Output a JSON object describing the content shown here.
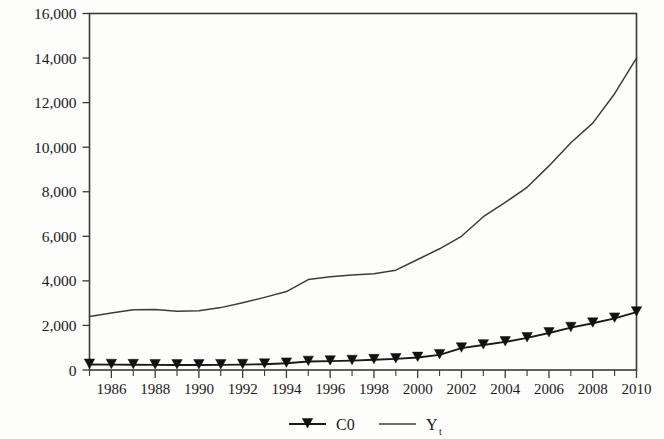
{
  "chart_data": {
    "type": "line",
    "title": "",
    "subtitle": "",
    "xlabel": "",
    "ylabel": "",
    "xlim": [
      1985,
      2010
    ],
    "ylim": [
      0,
      16000
    ],
    "grid": false,
    "legend_position": "bottom-center",
    "x": [
      1985,
      1986,
      1987,
      1988,
      1989,
      1990,
      1991,
      1992,
      1993,
      1994,
      1995,
      1996,
      1997,
      1998,
      1999,
      2000,
      2001,
      2002,
      2003,
      2004,
      2005,
      2006,
      2007,
      2008,
      2009,
      2010
    ],
    "y_tick_values": [
      0,
      2000,
      4000,
      6000,
      8000,
      10000,
      12000,
      14000,
      16000
    ],
    "y_tick_labels": [
      "0",
      "2,000",
      "4,000",
      "6,000",
      "8,000",
      "10,000",
      "12,000",
      "14,000",
      "16,000"
    ],
    "x_tick_values": [
      1986,
      1988,
      1990,
      1992,
      1994,
      1996,
      1998,
      2000,
      2002,
      2004,
      2006,
      2008,
      2010
    ],
    "x_tick_labels": [
      "1986",
      "1988",
      "1990",
      "1992",
      "1994",
      "1996",
      "1998",
      "2000",
      "2002",
      "2004",
      "2006",
      "2008",
      "2010"
    ],
    "x_minor_ticks_every": 1,
    "series": [
      {
        "name": "C0",
        "legend_label": "C0",
        "marker": "triangle-down",
        "color": "#1a1a1a",
        "values": [
          250,
          240,
          235,
          230,
          225,
          225,
          230,
          240,
          260,
          300,
          380,
          400,
          420,
          460,
          500,
          560,
          680,
          980,
          1120,
          1260,
          1440,
          1660,
          1900,
          2100,
          2320,
          2600
        ]
      },
      {
        "name": "Y",
        "legend_label": "Y",
        "legend_label_subscript": "t",
        "marker": "none",
        "color": "#3c3c3c",
        "values": [
          2400,
          2560,
          2700,
          2720,
          2640,
          2660,
          2800,
          3020,
          3260,
          3520,
          4060,
          4180,
          4260,
          4320,
          4480,
          4960,
          5440,
          6000,
          6880,
          7520,
          8200,
          9160,
          10200,
          11080,
          12400,
          14000
        ]
      }
    ]
  },
  "legend": {
    "items": [
      {
        "label": "C0",
        "marker": "triangle-down-with-line"
      },
      {
        "label": "Y",
        "subscript": "t",
        "marker": "line"
      }
    ]
  }
}
